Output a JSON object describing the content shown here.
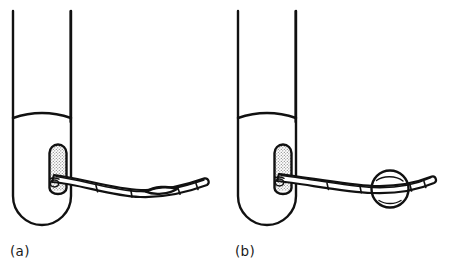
{
  "figure": {
    "background_color": "#ffffff",
    "ink_color": "#111111",
    "stipple_color": "#8a8a8a"
  },
  "panels": [
    {
      "id": "a",
      "label": "(a)",
      "caption_state": "balloon deflated",
      "balloon": {
        "state": "deflated",
        "shape": "lens",
        "name": "deflated-balloon"
      }
    },
    {
      "id": "b",
      "label": "(b)",
      "caption_state": "balloon inflated",
      "balloon": {
        "state": "inflated",
        "shape": "sphere",
        "name": "inflated-balloon"
      }
    }
  ],
  "parts": {
    "tube": "tube",
    "tube_wall_left": "tube-wall-left",
    "tube_wall_right": "tube-wall-right",
    "tube_base": "tube-rounded-base",
    "meniscus": "meniscus-line",
    "bolster": "stippled-retention-bolster",
    "catheter_shaft": "catheter-shaft",
    "catheter_tip": "catheter-tip",
    "catheter_bands": "catheter-marker-bands"
  },
  "geometry": {
    "canvas_width": 450,
    "canvas_height": 269,
    "panel_a_origin_x": 0,
    "panel_b_origin_x": 225
  }
}
